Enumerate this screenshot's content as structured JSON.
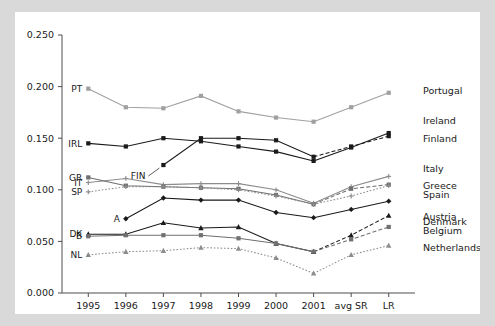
{
  "figure": {
    "background_color": "#d9d9d9",
    "panel_color": "#ffffff",
    "axis_color": "#4d4d4d"
  },
  "chart_data": {
    "type": "line",
    "title": "",
    "xlabel": "",
    "ylabel": "",
    "grid": false,
    "legend_position": "right-inline",
    "categories": [
      "1995",
      "1996",
      "1997",
      "1998",
      "1999",
      "2000",
      "2001",
      "avg SR",
      "LR"
    ],
    "ytick_labels": [
      "0.000",
      "0.050",
      "0.100",
      "0.150",
      "0.200",
      "0.250"
    ],
    "ytick_values": [
      0.0,
      0.05,
      0.1,
      0.15,
      0.2,
      0.25
    ],
    "ylim": [
      0.0,
      0.25
    ],
    "series": [
      {
        "name": "Portugal",
        "left_label": "PT",
        "right_label": "Portugal",
        "color": "#a0a0a0",
        "marker": "square",
        "linestyle": "solid",
        "values": [
          0.198,
          0.18,
          0.179,
          0.191,
          0.176,
          0.17,
          0.166,
          0.18,
          0.194
        ]
      },
      {
        "name": "Ireland",
        "left_label": "IRL",
        "right_label": "Ireland",
        "color": "#1a1a1a",
        "marker": "square",
        "linestyle": "solid",
        "values": [
          0.145,
          0.142,
          0.15,
          0.147,
          0.142,
          0.137,
          0.128,
          0.141,
          0.155
        ]
      },
      {
        "name": "Finland",
        "left_label": "FIN",
        "right_label": "Finland",
        "color": "#1a1a1a",
        "marker": "square",
        "linestyle": "dashed",
        "values": [
          null,
          null,
          0.124,
          0.15,
          0.15,
          0.148,
          0.132,
          0.142,
          0.152
        ]
      },
      {
        "name": "Italy",
        "left_label": "IT",
        "right_label": "Italy",
        "color": "#8c8c8c",
        "marker": "plus",
        "linestyle": "solid",
        "values": [
          0.107,
          0.111,
          0.105,
          0.106,
          0.106,
          0.1,
          0.087,
          0.103,
          0.113
        ]
      },
      {
        "name": "Greece",
        "left_label": "GR",
        "right_label": "Greece",
        "color": "#6e6e6e",
        "marker": "square",
        "linestyle": "dashed",
        "values": [
          0.112,
          0.104,
          0.103,
          0.102,
          0.101,
          0.095,
          0.086,
          0.101,
          0.105
        ]
      },
      {
        "name": "Spain",
        "left_label": "SP",
        "right_label": "Spain",
        "color": "#8c8c8c",
        "marker": "plus",
        "linestyle": "dotted",
        "values": [
          0.098,
          0.103,
          0.103,
          0.102,
          0.1,
          0.094,
          0.086,
          0.094,
          0.104
        ]
      },
      {
        "name": "Austria",
        "left_label": "A",
        "right_label": "Austria",
        "color": "#1a1a1a",
        "marker": "diamond",
        "linestyle": "solid",
        "values": [
          null,
          0.072,
          0.092,
          0.09,
          0.09,
          0.078,
          0.073,
          0.081,
          0.089
        ]
      },
      {
        "name": "Denmark",
        "left_label": "DK",
        "right_label": "Denmark",
        "color": "#1a1a1a",
        "marker": "triangle",
        "linestyle": "dashed",
        "values": [
          0.057,
          0.057,
          0.068,
          0.063,
          0.064,
          0.048,
          0.04,
          0.056,
          0.075
        ]
      },
      {
        "name": "Belgium",
        "left_label": "B",
        "right_label": "Belgium",
        "color": "#707070",
        "marker": "square",
        "linestyle": "dashed",
        "values": [
          0.055,
          0.056,
          0.056,
          0.056,
          0.053,
          0.048,
          0.04,
          0.052,
          0.064
        ]
      },
      {
        "name": "Netherlands",
        "left_label": "NL",
        "right_label": "Netherlands",
        "color": "#8c8c8c",
        "marker": "triangle",
        "linestyle": "dotted",
        "values": [
          0.037,
          0.04,
          0.041,
          0.044,
          0.043,
          0.034,
          0.019,
          0.037,
          0.046
        ]
      }
    ],
    "annotations": [
      {
        "text": "FIN",
        "note": "leader line pointing to Finland series start at 1997"
      }
    ]
  }
}
